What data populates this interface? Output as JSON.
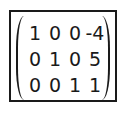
{
  "matrix": {
    "rows": [
      [
        "1",
        "0",
        "0",
        "-4"
      ],
      [
        "0",
        "1",
        "0",
        "5"
      ],
      [
        "0",
        "0",
        "1",
        "1"
      ]
    ],
    "bracket_style": "parentheses",
    "border_color": "#1a1a1a"
  }
}
